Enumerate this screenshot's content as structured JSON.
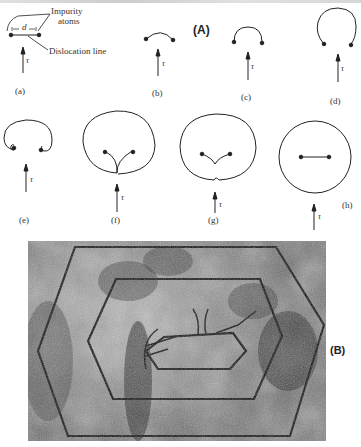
{
  "figure": {
    "panel_a_label": "(A)",
    "panel_b_label": "(B)",
    "annotations": {
      "impurity_atoms_line1": "Impurity",
      "impurity_atoms_line2": "atoms",
      "dislocation_line": "Dislocation line",
      "spacing": "d",
      "stress_symbol": "τ"
    },
    "stages": [
      {
        "label": "(a)",
        "shape": "straight-line"
      },
      {
        "label": "(b)",
        "shape": "shallow-arc"
      },
      {
        "label": "(c)",
        "shape": "semicircle"
      },
      {
        "label": "(d)",
        "shape": "three-quarter-loop"
      },
      {
        "label": "(e)",
        "shape": "curled-kidney"
      },
      {
        "label": "(f)",
        "shape": "loop-segments-meeting"
      },
      {
        "label": "(g)",
        "shape": "loop-pinched"
      },
      {
        "label": "(h)",
        "shape": "closed-loop-with-regenerated-line"
      }
    ],
    "micrograph": {
      "description": "Micrograph of concentric hexagonal dislocation loops emitted from a Frank-Read source"
    }
  }
}
